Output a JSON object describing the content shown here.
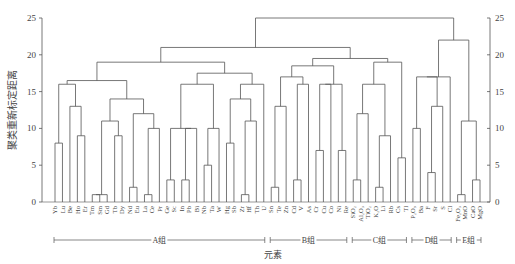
{
  "chart_data": {
    "type": "dendrogram",
    "title": "",
    "ylabel": "聚类重新标定距离",
    "xlabel": "元素",
    "ylim": [
      0,
      25
    ],
    "yticks": [
      0,
      5,
      10,
      15,
      20,
      25
    ],
    "axis_right": true,
    "leaves": [
      "Yb",
      "Lu",
      "Be",
      "Ho",
      "Er",
      "Tm",
      "Sm",
      "Gd",
      "Tb",
      "Dy",
      "Nd",
      "Eu",
      "La",
      "Ce",
      "Pr",
      "Ge",
      "Sc",
      "In",
      "Pb",
      "Bi",
      "Nb",
      "Ta",
      "W",
      "Hg",
      "Sb",
      "Zr",
      "Hf",
      "Th",
      "U",
      "Sn",
      "Te",
      "Zn",
      "Cd",
      "V",
      "As",
      "Cr",
      "Cu",
      "Co",
      "Ni",
      "Re",
      "SiO2",
      "Al2O3",
      "TiO2",
      "K2O",
      "Li",
      "Rb",
      "Cs",
      "Tl",
      "P2O5",
      "Ba",
      "F",
      "Sr",
      "S",
      "Cl",
      "Fe2O3",
      "MnO",
      "CaO",
      "MgO"
    ],
    "groups": [
      {
        "label": "A组",
        "from": "Yb",
        "to": "U"
      },
      {
        "label": "B组",
        "from": "Sn",
        "to": "Re"
      },
      {
        "label": "C组",
        "from": "SiO2",
        "to": "Tl"
      },
      {
        "label": "D组",
        "from": "P2O5",
        "to": "Cl"
      },
      {
        "label": "E组",
        "from": "Fe2O3",
        "to": "MgO"
      }
    ],
    "merge_heights_approx": {
      "root": 25,
      "ABC_vs_DE": 22,
      "A_B_C_vs": 20.5,
      "A_main": 19,
      "B_C": 18,
      "A_sub_left": 16,
      "D_group": 17,
      "E_group": 11
    }
  },
  "axis": {
    "left_ticks": [
      "0",
      "5",
      "10",
      "15",
      "20",
      "25"
    ],
    "right_ticks": [
      "0",
      "5",
      "10",
      "15",
      "20",
      "25"
    ],
    "ylabel": "聚类重新标定距离",
    "xlabel": "元素"
  },
  "group_labels": [
    "A组",
    "B组",
    "C组",
    "D组",
    "E组"
  ],
  "leaf_labels": [
    "Yb",
    "Lu",
    "Be",
    "Ho",
    "Er",
    "Tm",
    "Sm",
    "Gd",
    "Tb",
    "Dy",
    "Nd",
    "Eu",
    "La",
    "Ce",
    "Pr",
    "Ge",
    "Sc",
    "In",
    "Pb",
    "Bi",
    "Nb",
    "Ta",
    "W",
    "Hg",
    "Sb",
    "Zr",
    "Hf",
    "Th",
    "U",
    "Sn",
    "Te",
    "Zn",
    "Cd",
    "V",
    "As",
    "Cr",
    "Cu",
    "Co",
    "Ni",
    "Re",
    "SiO₂",
    "Al₂O₃",
    "TiO₂",
    "K₂O",
    "Li",
    "Rb",
    "Cs",
    "Tl",
    "P₂O₅",
    "Ba",
    "F",
    "Sr",
    "S",
    "Cl",
    "Fe₂O₃",
    "MnO",
    "CaO",
    "MgO"
  ]
}
